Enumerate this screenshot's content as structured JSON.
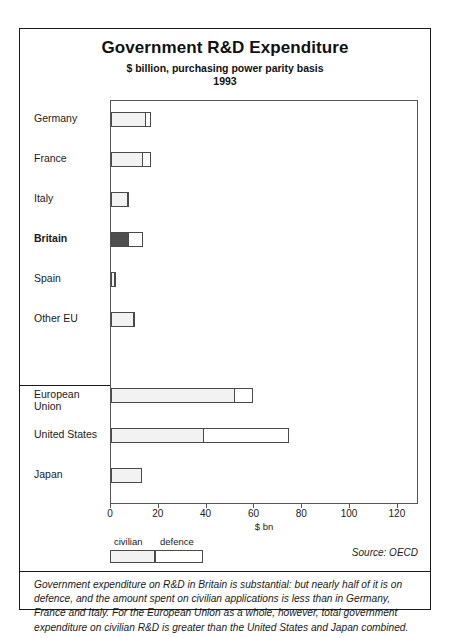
{
  "chart_data": {
    "type": "bar",
    "orientation": "horizontal",
    "stacked": true,
    "title": "Government R&D Expenditure",
    "subtitle": "$ billion, purchasing power parity basis",
    "year": "1993",
    "xlabel": "$ bn",
    "ylabel": "",
    "xlim": [
      0,
      128
    ],
    "xticks": [
      0,
      20,
      40,
      60,
      80,
      100,
      120
    ],
    "xtick_labels": [
      "0",
      "20",
      "40",
      "60",
      "80",
      "100",
      "120"
    ],
    "grid": false,
    "legend_position": "below-axis-left",
    "categories": [
      "Germany",
      "France",
      "Italy",
      "Britain",
      "Spain",
      "Other EU",
      "European Union",
      "United States",
      "Japan"
    ],
    "series": [
      {
        "name": "civilian",
        "values": [
          14.5,
          13.5,
          7.0,
          7.5,
          1.8,
          9.5,
          52.0,
          39.0,
          13.0
        ]
      },
      {
        "name": "defence",
        "values": [
          2.5,
          3.5,
          1.0,
          6.5,
          0.4,
          0.8,
          8.0,
          36.0,
          0.0
        ]
      }
    ],
    "totals": [
      17.0,
      17.0,
      8.0,
      14.0,
      2.2,
      10.3,
      60.0,
      75.0,
      13.0
    ],
    "highlight_category": "Britain",
    "group_separator_after": "Other EU",
    "source": "Source: OECD",
    "caption": "Government expenditure on R&D in Britain is substantial: but nearly half of it is on defence, and the amount spent on civilian applications is less than in Germany, France and Italy. For the European Union as a whole, however, total government expenditure on civilian R&D is greater than the United States and Japan combined.",
    "colors": {
      "civilian_fill": "#f2f2f2",
      "civilian_highlight_fill": "#4f4f4f",
      "defence_fill": "#ffffff",
      "bar_outline": "#4a4a4a",
      "frame": "#1a1a1a"
    }
  },
  "legend": {
    "items": [
      {
        "label": "civilian"
      },
      {
        "label": "defence"
      }
    ]
  }
}
